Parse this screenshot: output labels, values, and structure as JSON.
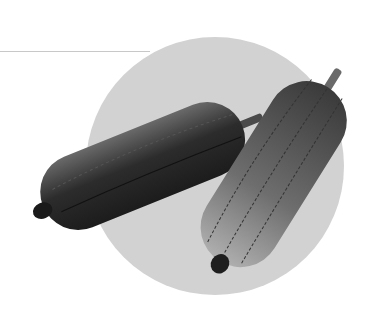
{
  "image": {
    "subject": "Two sponge gourds (luffa) on a light gray circular backdrop",
    "alt": "sponge gourds"
  },
  "colors": {
    "background": "#ffffff",
    "circle": "#d2d2d2",
    "rule": "#c8c8c8",
    "gourd_dark": "#2a2a2a",
    "gourd_mid": "#5a5a5a",
    "gourd_light": "#9a9a9a"
  },
  "geometry": {
    "circle_cx": 215,
    "circle_cy": 166,
    "circle_r": 129,
    "rule_y": 51,
    "rule_end_x": 150
  }
}
